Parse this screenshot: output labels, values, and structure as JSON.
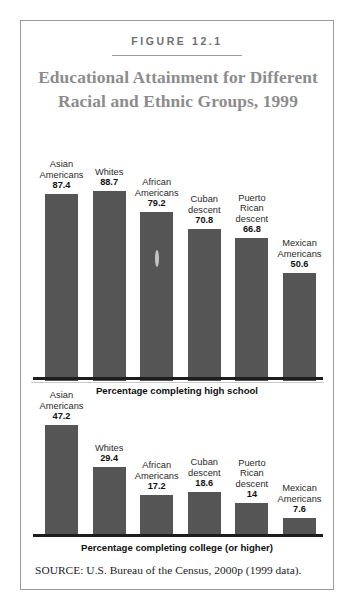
{
  "figure": {
    "number_label": "FIGURE 12.1",
    "title": "Educational Attainment for Different Racial and Ethnic Groups, 1999",
    "source": "SOURCE:  U.S. Bureau of the Census, 2000p (1999 data).",
    "bar_color": "#555555",
    "title_color": "#8c8c8c",
    "border_color": "#9a9a9a"
  },
  "chart_data": [
    {
      "type": "bar",
      "id": "high-school",
      "title": "Educational Attainment for Different Racial and Ethnic Groups, 1999",
      "xlabel": "Percentage completing high school",
      "ylabel": "",
      "ylim": [
        0,
        100
      ],
      "grid": false,
      "legend": "none",
      "categories": [
        "Asian Americans",
        "Whites",
        "African Americans",
        "Cuban descent",
        "Puerto Rican descent",
        "Mexican Americans"
      ],
      "values": [
        87.4,
        88.7,
        79.2,
        70.8,
        66.8,
        50.6
      ],
      "value_labels": [
        "87.4",
        "88.7",
        "79.2",
        "70.8",
        "66.8",
        "50.6"
      ]
    },
    {
      "type": "bar",
      "id": "college",
      "title": "Educational Attainment for Different Racial and Ethnic Groups, 1999",
      "xlabel": "Percentage completing college (or higher)",
      "ylabel": "",
      "ylim": [
        0,
        50
      ],
      "grid": false,
      "legend": "none",
      "categories": [
        "Asian Americans",
        "Whites",
        "African Americans",
        "Cuban descent",
        "Puerto Rican descent",
        "Mexican Americans"
      ],
      "values": [
        47.2,
        29.4,
        17.2,
        18.6,
        14,
        7.6
      ],
      "value_labels": [
        "47.2",
        "29.4",
        "17.2",
        "18.6",
        "14",
        "7.6"
      ]
    }
  ]
}
